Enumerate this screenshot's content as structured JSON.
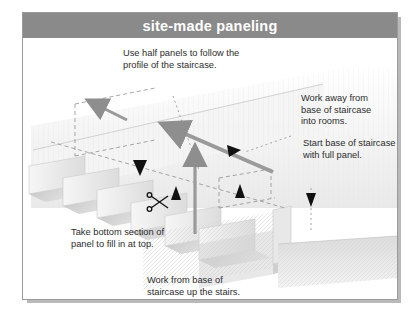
{
  "document": {
    "title": "site-made paneling",
    "type": "technical-illustration"
  },
  "header": {
    "title": "site-made paneling",
    "background_color": "#8a8a8a",
    "text_color": "#ffffff"
  },
  "illustration": {
    "subject": "staircase-paneling-diagram",
    "description": "Isometric drawing of a staircase with wall panels being installed",
    "colors": {
      "panel_light": "#f2f2f2",
      "panel_mid": "#e0e0e0",
      "panel_shade": "#cfcfcf",
      "tread_shadow": "#c9c9c9",
      "arrow_gray": "#9a9a9a",
      "arrow_black": "#111111",
      "dashed_line": "#8f8f8f",
      "outline": "#9a9a9a"
    },
    "markers": [
      {
        "name": "scissors-icon",
        "meaning": "cut line on panel"
      },
      {
        "name": "gray-arrow-diagonal",
        "meaning": "work away from base of staircase"
      },
      {
        "name": "gray-arrow-vertical",
        "meaning": "panel run direction upward"
      },
      {
        "name": "gray-arrow-small",
        "meaning": "half panel direction"
      },
      {
        "name": "black-arrowhead",
        "meaning": "callout pointer"
      }
    ]
  },
  "callouts": {
    "top": "Use half panels to follow the\nprofile of the staircase.",
    "right_upper": "Work away from\nbase of staircase\ninto rooms.",
    "right_lower": "Start base of staircase\nwith full panel.",
    "left_lower": "Take bottom section of\npanel to fill in at top.",
    "bottom": "Work from base of\nstaircase up the stairs."
  }
}
